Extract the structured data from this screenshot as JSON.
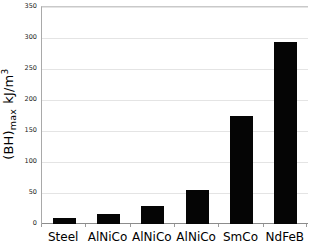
{
  "chart_data": {
    "type": "bar",
    "title": "",
    "subtitle": "",
    "xlabel": "",
    "ylabel": "(BH)max  kJ/m3",
    "ylabel_parts": {
      "main": "(BH)",
      "subscript": "max",
      "unit_numerator": "kJ/m",
      "unit_superscript": "3"
    },
    "categories": [
      "Steel",
      "AlNiCo",
      "AlNiCo",
      "AlNiCo",
      "SmCo",
      "NdFeB"
    ],
    "values": [
      10,
      16,
      29,
      55,
      175,
      293
    ],
    "ylim": [
      0,
      350
    ],
    "ytick_values": [
      0,
      50,
      100,
      150,
      200,
      250,
      300,
      350
    ],
    "ytick_labels": [
      "0",
      "50",
      "100",
      "150",
      "200",
      "250",
      "300",
      "350"
    ],
    "grid": true,
    "grid_axis": "y",
    "legend": false,
    "legend_position": "none",
    "bar_color": "#050505",
    "gridline_color": "#e4e4e4",
    "axis_color": "#8c8c8c",
    "background_color": "#ffffff",
    "bar_width_fraction": 0.52,
    "annotations": []
  }
}
